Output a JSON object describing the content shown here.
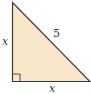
{
  "diagram": {
    "type": "right-triangle",
    "colors": {
      "fill": "#f8e6c8",
      "stroke": "#3a3a3a",
      "background": "#ffffff"
    },
    "labels": {
      "left_leg": "x",
      "hypotenuse": "5",
      "bottom_leg": "x"
    },
    "right_angle_marker": "bottom-left"
  }
}
